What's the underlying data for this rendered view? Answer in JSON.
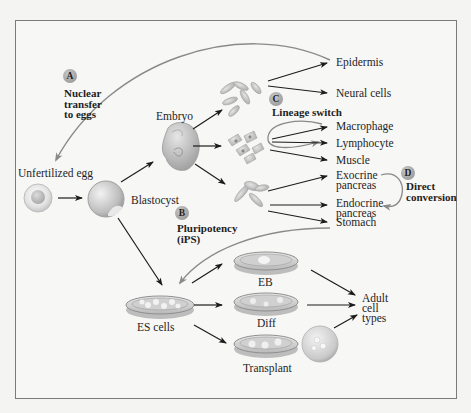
{
  "figure": {
    "type": "stem-cell-reprogramming-diagram",
    "colors": {
      "background": "#f4f4f2",
      "frame_border": "#7b7b7b",
      "arrow_black": "#1c1c1c",
      "arrow_gray": "#8a8a8a",
      "badge_fill": "#9c9c9c"
    }
  },
  "sources": {
    "unfertilized_egg": "Unfertilized egg",
    "blastocyst": "Blastocyst",
    "embryo": "Embryo",
    "es_cells": "ES cells"
  },
  "annotations": {
    "A": {
      "badge": "A",
      "lines": [
        "Nuclear",
        "transfer",
        "to eggs"
      ]
    },
    "B": {
      "badge": "B",
      "lines": [
        "Pluripotency",
        "(iPS)"
      ]
    },
    "C": {
      "badge": "C",
      "lines": [
        "Lineage switch"
      ]
    },
    "D": {
      "badge": "D",
      "lines": [
        "Direct",
        "conversion"
      ]
    }
  },
  "cell_types": [
    {
      "label": "Epidermis"
    },
    {
      "label": "Neural cells"
    },
    {
      "label": "Macrophage"
    },
    {
      "label": "Lymphocyte"
    },
    {
      "label": "Muscle"
    },
    {
      "label_lines": [
        "Exocrine",
        "pancreas"
      ]
    },
    {
      "label_lines": [
        "Endocrine",
        "pancreas"
      ]
    },
    {
      "label": "Stomach"
    }
  ],
  "culture_methods": [
    {
      "label": "EB"
    },
    {
      "label": "Diff"
    },
    {
      "label": "Transplant"
    }
  ],
  "outcome": {
    "lines": [
      "Adult",
      "cell",
      "types"
    ]
  }
}
